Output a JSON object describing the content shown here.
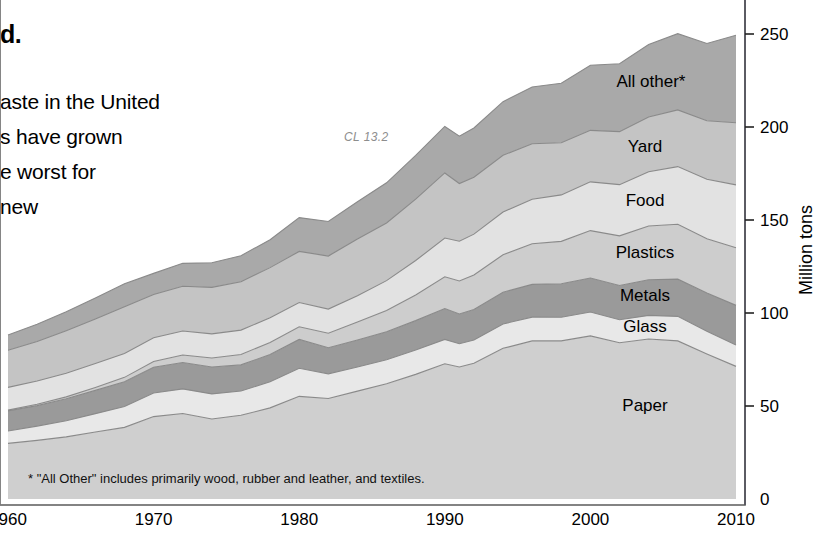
{
  "article_text": {
    "heading_fragment": "d.",
    "lines": [
      "aste in the United",
      "s have grown",
      "e worst for",
      "new"
    ]
  },
  "figure_id": "CL 13.2",
  "footnote": "* \"All Other\" includes primarily wood, rubber and leather, and textiles.",
  "colors": {
    "all_other": "#a9a9a9",
    "yard": "#c4c4c4",
    "food": "#e2e2e2",
    "plastics": "#cdcdcd",
    "metals": "#9a9a9a",
    "glass": "#e8e8e8",
    "paper": "#cfcfcf",
    "edge": "#8a8a8a",
    "axis": "#4a4a55",
    "figure_id": "#8d8d8d"
  },
  "chart_data": {
    "type": "area",
    "stacked": true,
    "title": "",
    "xlabel": "",
    "ylabel": "Million tons",
    "xlim": [
      1960,
      2010
    ],
    "ylim": [
      0,
      260
    ],
    "yticks": [
      0,
      50,
      100,
      150,
      200,
      250
    ],
    "xticks": [
      1960,
      1970,
      1980,
      1990,
      2000,
      2010
    ],
    "grid": false,
    "legend_position": "inline-labels",
    "x": [
      1960,
      1962,
      1964,
      1966,
      1968,
      1970,
      1972,
      1974,
      1976,
      1978,
      1980,
      1982,
      1984,
      1986,
      1988,
      1990,
      1991,
      1992,
      1994,
      1996,
      1998,
      2000,
      2002,
      2004,
      2006,
      2008,
      2010
    ],
    "series": [
      {
        "name": "Paper",
        "label": "Paper",
        "color": "#cfcfcf",
        "values": [
          29.9,
          31.5,
          33.4,
          36.0,
          38.5,
          44.3,
          46.0,
          43.0,
          45.0,
          49.0,
          55.2,
          54.0,
          58.0,
          62.0,
          67.0,
          72.7,
          71.0,
          73.0,
          81.0,
          85.0,
          85.0,
          87.7,
          84.0,
          86.0,
          85.0,
          78.0,
          71.3
        ]
      },
      {
        "name": "Glass",
        "label": "Glass",
        "color": "#e8e8e8",
        "values": [
          6.7,
          7.7,
          8.7,
          9.9,
          11.2,
          12.7,
          13.2,
          13.5,
          13.1,
          14.0,
          15.1,
          13.3,
          13.0,
          12.9,
          13.1,
          13.1,
          12.5,
          12.5,
          13.1,
          12.8,
          12.7,
          12.8,
          12.4,
          12.7,
          13.2,
          12.2,
          11.5
        ]
      },
      {
        "name": "Metals",
        "label": "Metals",
        "color": "#9a9a9a",
        "values": [
          10.8,
          11.0,
          11.8,
          12.5,
          13.3,
          13.8,
          14.2,
          14.5,
          14.0,
          14.7,
          15.5,
          14.0,
          14.5,
          15.0,
          15.8,
          16.6,
          16.0,
          16.4,
          17.1,
          17.6,
          18.0,
          18.3,
          18.4,
          19.2,
          20.0,
          20.5,
          21.3
        ]
      },
      {
        "name": "Plastics",
        "label": "Plastics",
        "color": "#cdcdcd",
        "values": [
          0.4,
          0.7,
          1.0,
          1.6,
          2.4,
          3.1,
          4.0,
          4.8,
          5.6,
          6.5,
          6.8,
          7.8,
          9.6,
          11.5,
          13.8,
          17.1,
          17.7,
          18.5,
          20.1,
          21.8,
          22.8,
          25.5,
          26.7,
          28.9,
          29.5,
          29.2,
          31.0
        ]
      },
      {
        "name": "Food",
        "label": "Food",
        "color": "#e2e2e2",
        "values": [
          12.2,
          12.5,
          12.7,
          12.8,
          12.8,
          12.8,
          12.9,
          13.0,
          13.1,
          13.2,
          13.0,
          13.0,
          14.2,
          16.0,
          18.5,
          20.8,
          21.4,
          22.0,
          23.0,
          24.0,
          25.0,
          26.2,
          27.5,
          29.1,
          31.0,
          32.0,
          33.8
        ]
      },
      {
        "name": "Yard",
        "label": "Yard",
        "color": "#c4c4c4",
        "values": [
          20.0,
          21.3,
          22.9,
          24.0,
          25.1,
          23.2,
          24.1,
          25.0,
          26.0,
          27.0,
          27.5,
          28.5,
          30.5,
          31.0,
          33.0,
          35.0,
          31.0,
          30.6,
          30.5,
          29.8,
          28.0,
          27.7,
          28.5,
          29.5,
          30.5,
          31.5,
          33.4
        ]
      },
      {
        "name": "All other*",
        "label": "All other*",
        "color": "#a9a9a9",
        "values": [
          8.2,
          9.2,
          10.2,
          11.2,
          12.4,
          11.4,
          12.3,
          13.2,
          14.0,
          15.0,
          18.2,
          18.6,
          20.0,
          21.6,
          23.5,
          25.0,
          25.5,
          26.5,
          28.8,
          30.5,
          32.0,
          35.0,
          36.5,
          39.0,
          41.0,
          41.5,
          47.0
        ]
      }
    ],
    "series_label_positions": [
      {
        "name": "Paper",
        "x": 645,
        "y": 411
      },
      {
        "name": "Glass",
        "x": 645,
        "y": 332
      },
      {
        "name": "Metals",
        "x": 645,
        "y": 301
      },
      {
        "name": "Plastics",
        "x": 645,
        "y": 258
      },
      {
        "name": "Food",
        "x": 645,
        "y": 206
      },
      {
        "name": "Yard",
        "x": 645,
        "y": 152
      },
      {
        "name": "All other*",
        "x": 651,
        "y": 87
      }
    ]
  }
}
